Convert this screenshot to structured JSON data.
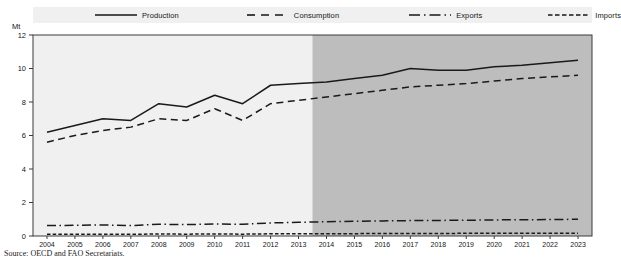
{
  "title_partial": "",
  "unit_label": "Mt",
  "source_note": "Source:  OECD and FAO Secretariats.",
  "legend": [
    {
      "label": "Production",
      "style": "solid",
      "name": "legend-production"
    },
    {
      "label": "Consumption",
      "style": "dashed",
      "name": "legend-consumption"
    },
    {
      "label": "Exports",
      "style": "dashdot",
      "name": "legend-exports"
    },
    {
      "label": "Imports",
      "style": "finedash",
      "name": "legend-imports"
    }
  ],
  "colors": {
    "line": "#1a1a1a",
    "plot_background": "#f0f0f0",
    "projection_background": "#bdbdbd",
    "axis": "#3a3a3a"
  },
  "chart_data": {
    "type": "line",
    "title": "",
    "xlabel": "",
    "ylabel": "Mt",
    "ylim": [
      0,
      12
    ],
    "yticks": [
      0,
      2,
      4,
      6,
      8,
      10,
      12
    ],
    "grid": false,
    "legend_position": "top",
    "projection_start": 2014,
    "x": [
      2004,
      2005,
      2006,
      2007,
      2008,
      2009,
      2010,
      2011,
      2012,
      2013,
      2014,
      2015,
      2016,
      2017,
      2018,
      2019,
      2020,
      2021,
      2022,
      2023
    ],
    "categories": [
      "2004",
      "2005",
      "2006",
      "2007",
      "2008",
      "2009",
      "2010",
      "2011",
      "2012",
      "2013",
      "2014",
      "2015",
      "2016",
      "2017",
      "2018",
      "2019",
      "2020",
      "2021",
      "2022",
      "2023"
    ],
    "series": [
      {
        "name": "Production",
        "style": "solid",
        "values": [
          6.2,
          6.6,
          7.0,
          6.9,
          7.9,
          7.7,
          8.4,
          7.9,
          9.0,
          9.1,
          9.2,
          9.4,
          9.6,
          10.0,
          9.9,
          9.9,
          10.1,
          10.2,
          10.35,
          10.5
        ]
      },
      {
        "name": "Consumption",
        "style": "dashed",
        "values": [
          5.6,
          6.0,
          6.3,
          6.5,
          7.0,
          6.9,
          7.6,
          6.9,
          7.9,
          8.1,
          8.3,
          8.5,
          8.7,
          8.9,
          9.0,
          9.1,
          9.25,
          9.4,
          9.5,
          9.6
        ]
      },
      {
        "name": "Exports",
        "style": "dashdot",
        "values": [
          0.62,
          0.64,
          0.66,
          0.62,
          0.7,
          0.68,
          0.72,
          0.7,
          0.78,
          0.82,
          0.85,
          0.88,
          0.9,
          0.92,
          0.93,
          0.94,
          0.96,
          0.97,
          0.98,
          1.0
        ]
      },
      {
        "name": "Imports",
        "style": "finedash",
        "values": [
          0.1,
          0.1,
          0.11,
          0.1,
          0.12,
          0.11,
          0.12,
          0.11,
          0.13,
          0.13,
          0.14,
          0.14,
          0.15,
          0.15,
          0.15,
          0.16,
          0.16,
          0.16,
          0.17,
          0.17
        ]
      }
    ]
  }
}
